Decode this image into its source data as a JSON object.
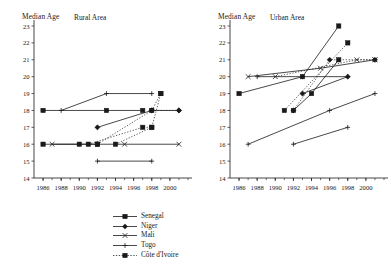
{
  "figure": {
    "width": 392,
    "height": 265,
    "background": "#ffffff",
    "ink": "#1a1a1a"
  },
  "panels": [
    {
      "id": "rural",
      "title": "Rural Area",
      "ylabel": "Median Age"
    },
    {
      "id": "urban",
      "title": "Urban Area",
      "ylabel": "Median Age"
    }
  ],
  "chart_data": [
    {
      "type": "line",
      "title": "Rural Area",
      "xlabel": "",
      "ylabel": "Median Age",
      "xlim": [
        1985,
        2002
      ],
      "ylim": [
        14,
        23
      ],
      "yticks": [
        14,
        15,
        16,
        17,
        18,
        19,
        20,
        21,
        22,
        23
      ],
      "xticks": [
        1986,
        1988,
        1990,
        1992,
        1994,
        1996,
        1998,
        2000
      ],
      "xtick_labels": [
        "1986",
        "1988",
        "1990",
        "1992",
        "1994",
        "1996",
        "1998",
        "2000"
      ],
      "grid": false,
      "legend_position": "below-right",
      "series": [
        {
          "name": "Senegal",
          "marker": "square-filled",
          "linestyle": "solid",
          "x": [
            1986,
            1993,
            1997
          ],
          "y": [
            18.0,
            18.0,
            18.0
          ]
        },
        {
          "name": "Niger",
          "marker": "diamond",
          "linestyle": "solid",
          "x": [
            1992,
            1998,
            2001
          ],
          "y": [
            17.0,
            18.0,
            18.0
          ]
        },
        {
          "name": "Mali",
          "marker": "cross",
          "linestyle": "solid",
          "x": [
            1987,
            1995,
            2001
          ],
          "y": [
            16.0,
            16.0,
            16.0
          ]
        },
        {
          "name": "Togo",
          "marker": "plus-small",
          "linestyle": "solid",
          "x": [
            1988,
            1993,
            1998
          ],
          "y": [
            18.0,
            19.0,
            19.0
          ]
        },
        {
          "name": "Côte d'Ivoire",
          "marker": "square-filled",
          "linestyle": "dotted",
          "x": [
            1994,
            1998,
            1999
          ],
          "y": [
            16.0,
            17.0,
            19.0
          ]
        }
      ],
      "extra_series": [
        {
          "name": "low-line-a",
          "marker": "square-filled",
          "linestyle": "solid",
          "x": [
            1986,
            1990,
            1992
          ],
          "y": [
            16.0,
            16.0,
            16.0
          ]
        },
        {
          "name": "low-line-b",
          "marker": "plus-small",
          "linestyle": "solid",
          "x": [
            1992,
            1998
          ],
          "y": [
            15.0,
            15.0
          ]
        },
        {
          "name": "dotted-rise",
          "marker": "square-filled",
          "linestyle": "dotted",
          "x": [
            1991,
            1997,
            1998
          ],
          "y": [
            16.0,
            17.0,
            17.0
          ]
        },
        {
          "name": "dotted-up",
          "marker": "square-filled",
          "linestyle": "dotted",
          "x": [
            1992,
            1998,
            1999
          ],
          "y": [
            16.0,
            18.0,
            19.0
          ]
        },
        {
          "name": "flat-18",
          "marker": "diamond",
          "linestyle": "dotted",
          "x": [
            1998,
            2001
          ],
          "y": [
            18.0,
            18.0
          ]
        }
      ]
    },
    {
      "type": "line",
      "title": "Urban Area",
      "xlabel": "",
      "ylabel": "Median Age",
      "xlim": [
        1985,
        2002
      ],
      "ylim": [
        14,
        23
      ],
      "yticks": [
        14,
        15,
        16,
        17,
        18,
        19,
        20,
        21,
        22,
        23
      ],
      "xticks": [
        1986,
        1988,
        1990,
        1992,
        1994,
        1996,
        1998,
        2000
      ],
      "xtick_labels": [
        "1986",
        "1988",
        "1990",
        "1992",
        "1994",
        "1996",
        "1998",
        "2000"
      ],
      "grid": false,
      "legend_position": "below-right",
      "series": [
        {
          "name": "Ghana",
          "marker": "plus-small",
          "linestyle": "solid",
          "x": [
            1987,
            1996,
            2001
          ],
          "y": [
            16.0,
            18.0,
            19.0
          ]
        },
        {
          "name": "Nigeria",
          "marker": "cross",
          "linestyle": "dotted",
          "x": [
            1990,
            1999,
            2001
          ],
          "y": [
            20.0,
            21.0,
            21.0
          ]
        },
        {
          "name": "Cameroon",
          "marker": "square-filled",
          "linestyle": "dotted",
          "x": [
            1991,
            1998
          ],
          "y": [
            18.0,
            22.0
          ]
        },
        {
          "name": "Benin",
          "marker": "diamond",
          "linestyle": "dotted",
          "x": [
            1992,
            1996,
            2001
          ],
          "y": [
            18.0,
            21.0,
            21.0
          ]
        },
        {
          "name": "Burkina Faso",
          "marker": "diamond-filled",
          "linestyle": "solid",
          "x": [
            1993,
            1998
          ],
          "y": [
            19.0,
            20.0
          ]
        }
      ],
      "extra_series": [
        {
          "name": "senegal-u",
          "marker": "square-filled",
          "linestyle": "solid",
          "x": [
            1986,
            1993,
            1997
          ],
          "y": [
            19.0,
            20.0,
            23.0
          ]
        },
        {
          "name": "flat-20",
          "marker": "plus-small",
          "linestyle": "solid",
          "x": [
            1988,
            1993,
            1998
          ],
          "y": [
            20.0,
            20.0,
            20.0
          ]
        },
        {
          "name": "mali-u",
          "marker": "cross",
          "linestyle": "solid",
          "x": [
            1987,
            1995,
            2001
          ],
          "y": [
            20.0,
            20.5,
            21.0
          ]
        },
        {
          "name": "low-17",
          "marker": "plus-small",
          "linestyle": "solid",
          "x": [
            1992,
            1998
          ],
          "y": [
            16.0,
            17.0
          ]
        },
        {
          "name": "dark-rise",
          "marker": "square-filled",
          "linestyle": "solid",
          "x": [
            1992,
            1994,
            1997
          ],
          "y": [
            18.0,
            19.0,
            21.0
          ]
        }
      ]
    }
  ],
  "legends": [
    {
      "panel": "rural",
      "entries": [
        {
          "label": "Senegal",
          "marker": "square-filled",
          "linestyle": "solid"
        },
        {
          "label": "Niger",
          "marker": "diamond",
          "linestyle": "solid"
        },
        {
          "label": "Mali",
          "marker": "cross",
          "linestyle": "solid"
        },
        {
          "label": "Togo",
          "marker": "plus-small",
          "linestyle": "solid"
        },
        {
          "label": "Côte d'Ivoire",
          "marker": "square-filled",
          "linestyle": "dotted"
        }
      ]
    },
    {
      "panel": "urban",
      "entries": [
        {
          "label": "Ghana",
          "marker": "plus-small",
          "linestyle": "solid"
        },
        {
          "label": "Nigeria",
          "marker": "cross",
          "linestyle": "dotted"
        },
        {
          "label": "Cameroon",
          "marker": "square-filled",
          "linestyle": "dotted"
        },
        {
          "label": "Benin",
          "marker": "diamond",
          "linestyle": "dotted"
        },
        {
          "label": "Burkina Faso",
          "marker": "diamond-filled",
          "linestyle": "solid"
        }
      ]
    }
  ]
}
